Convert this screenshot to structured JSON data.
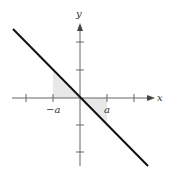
{
  "diagram": {
    "type": "coordinate-graph",
    "axes": {
      "x_label": "x",
      "y_label": "y"
    },
    "tick_labels": {
      "neg_a": "−a",
      "pos_a": "a"
    },
    "line": {
      "description": "y = -x",
      "color": "#111111"
    },
    "shaded_regions": [
      {
        "name": "left-triangle",
        "vertices": [
          [
            "-a",
            0
          ],
          [
            "-a",
            "a"
          ],
          [
            0,
            0
          ]
        ]
      },
      {
        "name": "right-triangle",
        "vertices": [
          [
            0,
            0
          ],
          [
            "a",
            0
          ],
          [
            "a",
            "-a"
          ]
        ]
      }
    ],
    "shade_color": "#e6e6e6",
    "axis_color": "#555555"
  }
}
